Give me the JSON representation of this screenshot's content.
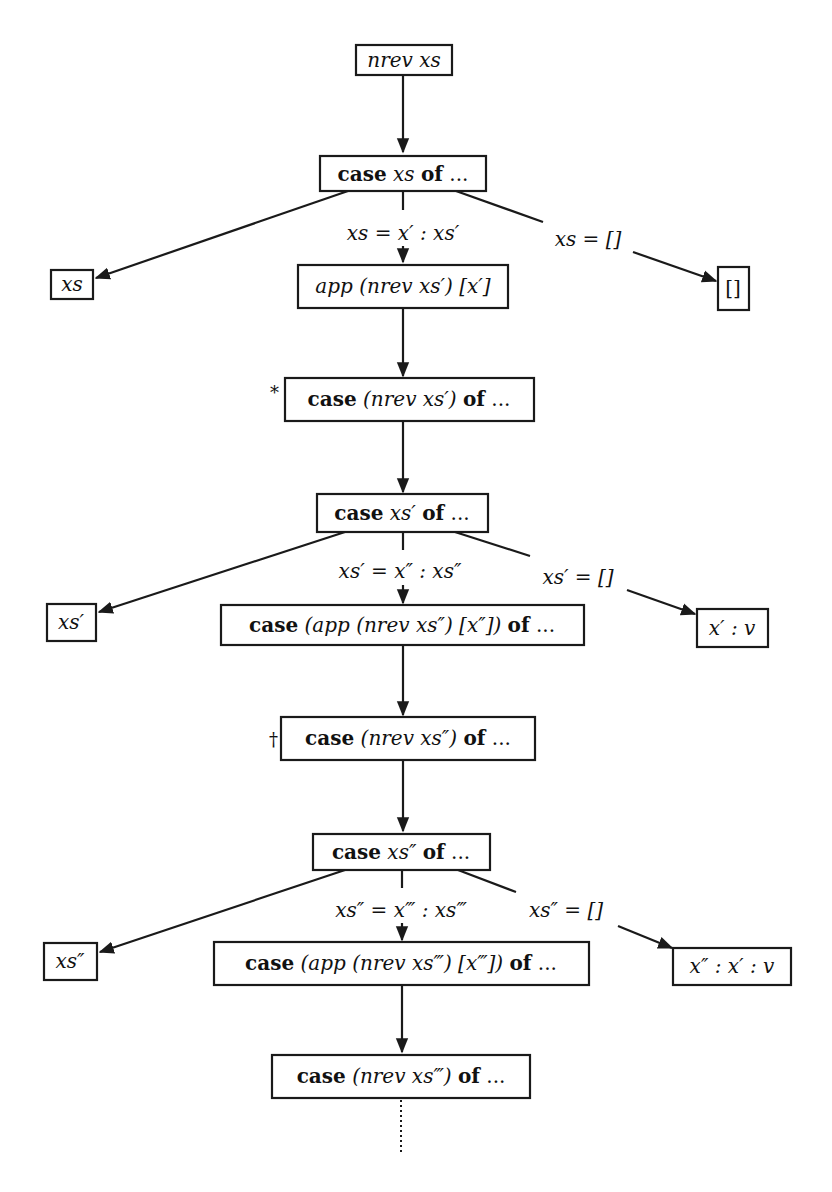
{
  "diagram": {
    "type": "evaluation-tree",
    "nodes": {
      "n1": {
        "text": "nrev xs"
      },
      "n2": {
        "text": "case xs of ..."
      },
      "n3": {
        "text": "xs"
      },
      "n4": {
        "text": "app (nrev xs′) [x′]"
      },
      "n5": {
        "text": "[]"
      },
      "n6": {
        "text": "case (nrev xs′) of ...",
        "marker": "*"
      },
      "n7": {
        "text": "case xs′ of ..."
      },
      "n8": {
        "text": "xs′"
      },
      "n9": {
        "text": "case (app (nrev xs″) [x″]) of ..."
      },
      "n10": {
        "text": "x′ : v"
      },
      "n11": {
        "text": "case (nrev xs″) of ...",
        "marker": "†"
      },
      "n12": {
        "text": "case xs″ of ..."
      },
      "n13": {
        "text": "xs″"
      },
      "n14": {
        "text": "case (app (nrev xs‴) [x‴]) of ..."
      },
      "n15": {
        "text": "x″ : x′ : v"
      },
      "n16": {
        "text": "case (nrev xs‴) of ..."
      }
    },
    "edge_labels": {
      "e1_cons": "xs = x′ : xs′",
      "e1_nil": "xs = []",
      "e2_cons": "xs′ = x″ : xs″",
      "e2_nil": "xs′ = []",
      "e3_cons": "xs″ = x‴ : xs‴",
      "e3_nil": "xs″ = []"
    },
    "parts": {
      "case": "case",
      "of": "of",
      "dots": "...",
      "n1": "nrev xs",
      "n2_var": "xs",
      "n3": "xs",
      "n4": "app (nrev xs′) [x′]",
      "n5": "[]",
      "n6_mid": "(nrev xs′)",
      "n7_var": "xs′",
      "n8": "xs′",
      "n9_mid": "(app (nrev xs″) [x″])",
      "n10": "x′ : v",
      "n11_mid": "(nrev xs″)",
      "n12_var": "xs″",
      "n13": "xs″",
      "n14_mid": "(app (nrev xs‴) [x‴])",
      "n15": "x″ : x′ : v",
      "n16_mid": "(nrev xs‴)",
      "marker_star": "*",
      "marker_dagger": "†"
    },
    "continuation": "dotted-line"
  }
}
